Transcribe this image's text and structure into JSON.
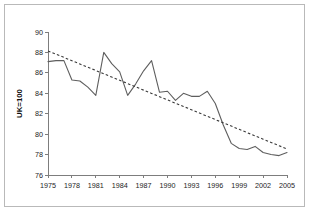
{
  "chart_data": {
    "type": "line",
    "title": "",
    "subtitle": "",
    "xlabel": "",
    "ylabel": "UK=100",
    "xlim": [
      1975,
      2005
    ],
    "ylim": [
      76,
      90
    ],
    "ytick_step": 2,
    "xtick_step": 3,
    "grid": false,
    "legend": "none",
    "x": [
      1975,
      1976,
      1977,
      1978,
      1979,
      1980,
      1981,
      1982,
      1983,
      1984,
      1985,
      1986,
      1987,
      1988,
      1989,
      1990,
      1991,
      1992,
      1993,
      1994,
      1995,
      1996,
      1997,
      1998,
      1999,
      2000,
      2001,
      2002,
      2003,
      2004,
      2005
    ],
    "series": [
      {
        "name": "UK=100 index",
        "style": "solid",
        "values": [
          87.1,
          87.2,
          87.2,
          85.3,
          85.2,
          84.6,
          83.8,
          88.0,
          86.9,
          86.1,
          83.8,
          84.9,
          86.2,
          87.2,
          84.1,
          84.2,
          83.3,
          84.0,
          83.7,
          83.7,
          84.2,
          83.0,
          80.9,
          79.1,
          78.6,
          78.5,
          78.8,
          78.2,
          78.0,
          77.9,
          78.2
        ]
      },
      {
        "name": "Linear trend",
        "style": "dashed",
        "values": [
          88.15,
          87.83,
          87.51,
          87.19,
          86.87,
          86.55,
          86.23,
          85.91,
          85.59,
          85.27,
          84.95,
          84.63,
          84.31,
          83.99,
          83.67,
          83.35,
          83.03,
          82.71,
          82.39,
          82.07,
          81.75,
          81.43,
          81.11,
          80.79,
          80.47,
          80.15,
          79.83,
          79.51,
          79.19,
          78.87,
          78.55
        ]
      }
    ],
    "xticks": [
      "1975",
      "1978",
      "1981",
      "1984",
      "1987",
      "1990",
      "1993",
      "1996",
      "1999",
      "2002",
      "2005"
    ],
    "xtick_values": [
      1975,
      1978,
      1981,
      1984,
      1987,
      1990,
      1993,
      1996,
      1999,
      2002,
      2005
    ],
    "yticks": [
      "76",
      "78",
      "80",
      "82",
      "84",
      "86",
      "88",
      "90"
    ],
    "ytick_values": [
      76,
      78,
      80,
      82,
      84,
      86,
      88,
      90
    ],
    "colors": {
      "series_line": "#5e5e5e",
      "trend_line": "#3a3a3a",
      "axis": "#7d7d7d",
      "text": "#1d1d1d",
      "frame": "#b9b9b9",
      "background": "#ffffff"
    }
  }
}
